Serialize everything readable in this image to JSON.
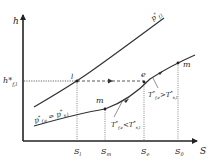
{
  "diagram": {
    "type": "phase diagram (h–S)",
    "axes": {
      "y_label": "h",
      "x_label": "S"
    },
    "curves": [
      {
        "name": "upper-curve",
        "label": "p*f,l"
      },
      {
        "name": "lower-curve",
        "label": "p*f,e = p*s,l"
      }
    ],
    "points": {
      "I": "l",
      "E": "e",
      "M1": "m",
      "M2": "m"
    },
    "y_marks": [
      {
        "label": "h*",
        "sub": "f,l"
      }
    ],
    "x_marks": [
      {
        "label": "S",
        "sub": "l"
      },
      {
        "label": "S",
        "sub": "m"
      },
      {
        "label": "S",
        "sub": "e"
      },
      {
        "label": "S",
        "sub": "0"
      }
    ],
    "annotations": [
      {
        "text": "T*f,e < T*s,l",
        "main1": "T",
        "sub1": "f,e",
        "op": "<",
        "main2": "T",
        "sub2": "s,l"
      },
      {
        "text": "T*f,e > T*s,l",
        "main1": "T",
        "sub1": "f,e",
        "op": ">",
        "main2": "T",
        "sub2": "s,l"
      }
    ],
    "colors": {
      "line": "#333333",
      "background": "#ffffff"
    }
  }
}
